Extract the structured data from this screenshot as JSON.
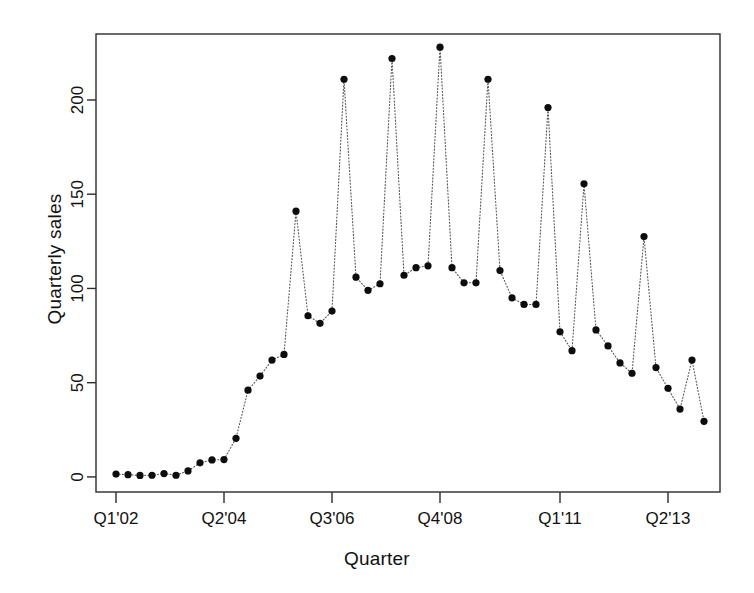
{
  "chart_data": {
    "type": "scatter",
    "title": "",
    "xlabel": "Quarter",
    "ylabel": "Quarterly sales",
    "grid": false,
    "legend": false,
    "line_style": "dotted",
    "marker": "filled-circle",
    "point_color": "#0d0d0d",
    "line_color": "#555555",
    "ylim": [
      -8,
      235
    ],
    "yticks": [
      0,
      50,
      100,
      150,
      200
    ],
    "ytick_labels": [
      "0",
      "50",
      "100",
      "150",
      "200"
    ],
    "xtick_indices": [
      0,
      9,
      18,
      27,
      37,
      46
    ],
    "xtick_labels": [
      "Q1'02",
      "Q2'04",
      "Q3'06",
      "Q4'08",
      "Q1'11",
      "Q2'13"
    ],
    "x": [
      "Q1'02",
      "Q2'02",
      "Q3'02",
      "Q4'02",
      "Q1'03",
      "Q2'03",
      "Q3'03",
      "Q4'03",
      "Q1'04",
      "Q2'04",
      "Q3'04",
      "Q4'04",
      "Q1'05",
      "Q2'05",
      "Q3'05",
      "Q4'05",
      "Q1'06",
      "Q2'06",
      "Q3'06",
      "Q4'06",
      "Q1'07",
      "Q2'07",
      "Q3'07",
      "Q4'07",
      "Q1'08",
      "Q2'08",
      "Q3'08",
      "Q4'08",
      "Q1'09",
      "Q2'09",
      "Q3'09",
      "Q4'09",
      "Q1'10",
      "Q2'10",
      "Q3'10",
      "Q4'10",
      "Q1'11",
      "Q2'11",
      "Q3'11",
      "Q4'11",
      "Q1'12",
      "Q2'12",
      "Q3'12",
      "Q4'12",
      "Q1'13",
      "Q2'13",
      "Q3'13",
      "Q4'13",
      "Q1'14",
      "Q2'14"
    ],
    "values": [
      1.5,
      1.2,
      0.8,
      0.9,
      1.8,
      0.9,
      3.2,
      7.5,
      9.0,
      9.2,
      20.5,
      46.0,
      53.5,
      62.0,
      65.0,
      141.0,
      85.5,
      81.5,
      88.0,
      211.0,
      106.0,
      99.0,
      102.5,
      222.0,
      107.0,
      111.0,
      112.0,
      228.0,
      111.0,
      103.0,
      103.0,
      211.0,
      109.5,
      95.0,
      91.5,
      91.5,
      196.0,
      77.0,
      67.0,
      155.5,
      78.0,
      69.5,
      60.5,
      55.0,
      127.5,
      58.0,
      47.0,
      36.0,
      62.0,
      29.5
    ],
    "series_name": "Quarterly sales"
  },
  "axes": {
    "x_axis_name": "quarter-axis",
    "y_axis_name": "sales-axis"
  }
}
